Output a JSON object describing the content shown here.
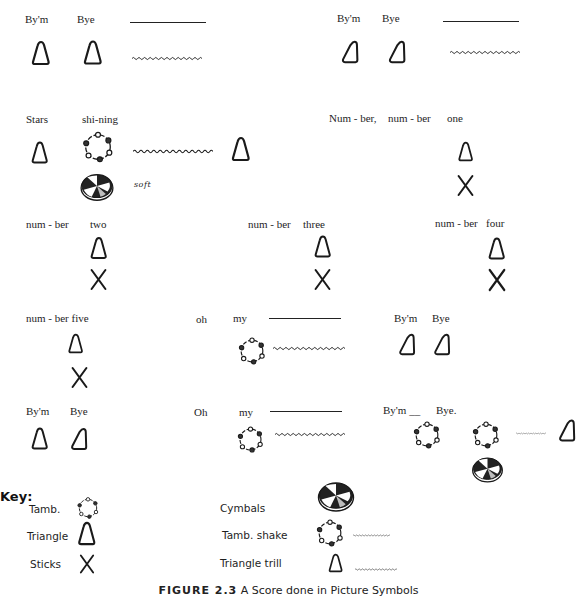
{
  "figure": {
    "caption_label": "FIGURE 2.3",
    "caption_text": "A Score done in Picture Symbols"
  },
  "score": {
    "line1_left": {
      "words": [
        "By'm",
        "Bye"
      ]
    },
    "line1_right": {
      "words": [
        "By'm",
        "Bye"
      ]
    },
    "line2_left": {
      "words": [
        "Stars",
        "shi-ning"
      ],
      "dynamic": "soft"
    },
    "line2_right": {
      "words": [
        "Num - ber,",
        "num - ber",
        "one"
      ]
    },
    "line3_a": {
      "words": [
        "num - ber",
        "two"
      ]
    },
    "line3_b": {
      "words": [
        "num - ber",
        "three"
      ]
    },
    "line3_c": {
      "words": [
        "num - ber",
        "four"
      ]
    },
    "line4_a": {
      "words": [
        "num - ber five"
      ]
    },
    "line4_b": {
      "words": [
        "oh",
        "my"
      ]
    },
    "line4_c": {
      "words": [
        "By'm",
        "Bye"
      ]
    },
    "line5_a": {
      "words": [
        "By'm",
        "Bye"
      ]
    },
    "line5_b": {
      "words": [
        "Oh",
        "my"
      ]
    },
    "line5_c": {
      "words": [
        "By'm __",
        "Bye."
      ]
    }
  },
  "key": {
    "heading": "Key:",
    "items": [
      {
        "label": "Tamb.",
        "icon": "tambourine-icon"
      },
      {
        "label": "Triangle",
        "icon": "triangle-icon"
      },
      {
        "label": "Sticks",
        "icon": "sticks-icon"
      },
      {
        "label": "Cymbals",
        "icon": "cymbals-icon"
      },
      {
        "label": "Tamb. shake",
        "icon": "tambourine-shake-icon"
      },
      {
        "label": "Triangle  trill",
        "icon": "triangle-trill-icon"
      }
    ]
  }
}
